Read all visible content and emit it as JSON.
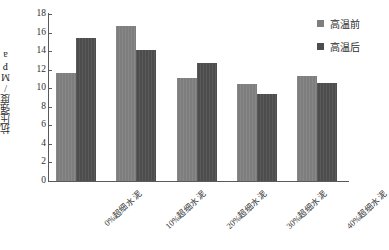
{
  "chart_data": {
    "type": "bar",
    "title": "",
    "xlabel": "",
    "ylabel": "抗压强度/MPa",
    "ylim": [
      0,
      18
    ],
    "ytick_step": 2,
    "yticks": [
      "18",
      "16",
      "14",
      "12",
      "10",
      "8",
      "6",
      "4",
      "2",
      "0"
    ],
    "grid": false,
    "legend_position": "top-right",
    "categories": [
      "0%超细水泥",
      "10%超细水泥",
      "20%超细水泥",
      "30%超细水泥",
      "40%超细水泥"
    ],
    "series": [
      {
        "name": "高温前",
        "color": "#7e7e7e",
        "values": [
          11.6,
          16.7,
          11.1,
          10.5,
          11.3
        ]
      },
      {
        "name": "高温后",
        "color": "#4d4d4d",
        "values": [
          15.4,
          14.1,
          12.7,
          9.4,
          10.6
        ]
      }
    ]
  },
  "legend": {
    "items": [
      {
        "label": "高温前",
        "color": "#7e7e7e",
        "swatch": "square-marker-icon"
      },
      {
        "label": "高温后",
        "color": "#4d4d4d",
        "swatch": "square-marker-icon"
      }
    ]
  },
  "axes": {
    "y_title": "抗压强度/MPa"
  }
}
